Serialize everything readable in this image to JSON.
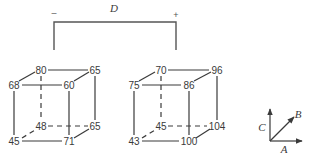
{
  "bracket": {
    "label": "D",
    "minus_sign": "–",
    "plus_sign": "+"
  },
  "cube_left": {
    "front_top_left": "68",
    "front_top_right": "60",
    "front_bottom_left": "45",
    "front_bottom_right": "71",
    "back_top_left": "80",
    "back_top_right": "65",
    "back_bottom_left": "48",
    "back_bottom_right": "65"
  },
  "cube_right": {
    "front_top_left": "75",
    "front_top_right": "86",
    "front_bottom_left": "43",
    "front_bottom_right": "100",
    "back_top_left": "70",
    "back_top_right": "96",
    "back_bottom_left": "45",
    "back_bottom_right": "104"
  },
  "axes": {
    "x_label": "A",
    "diag_label": "B",
    "y_label": "C"
  },
  "colors": {
    "line": "#3a3a3a",
    "background": "#ffffff"
  }
}
